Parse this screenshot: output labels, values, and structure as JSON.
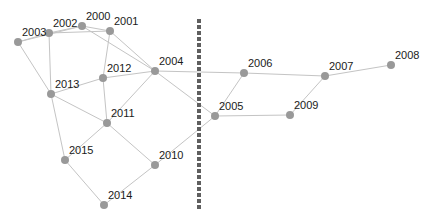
{
  "diagram": {
    "type": "network-graph",
    "node_color": "#999999",
    "edge_color": "#c4c4c4",
    "divider": {
      "x": 199,
      "y1": 19,
      "y2": 209,
      "color": "#5f5f5f",
      "style": "dashed"
    },
    "nodes": [
      {
        "id": "2000",
        "label": "2000",
        "x": 82,
        "y": 26,
        "lx": 4,
        "ly": -6
      },
      {
        "id": "2001",
        "label": "2001",
        "x": 110,
        "y": 31,
        "lx": 4,
        "ly": -6
      },
      {
        "id": "2002",
        "label": "2002",
        "x": 49,
        "y": 33,
        "lx": 4,
        "ly": -6
      },
      {
        "id": "2003",
        "label": "2003",
        "x": 18,
        "y": 42,
        "lx": 4,
        "ly": -6
      },
      {
        "id": "2004",
        "label": "2004",
        "x": 155,
        "y": 71,
        "lx": 4,
        "ly": -6
      },
      {
        "id": "2005",
        "label": "2005",
        "x": 215,
        "y": 116,
        "lx": 4,
        "ly": -6
      },
      {
        "id": "2006",
        "label": "2006",
        "x": 244,
        "y": 73,
        "lx": 4,
        "ly": -6
      },
      {
        "id": "2007",
        "label": "2007",
        "x": 325,
        "y": 76,
        "lx": 4,
        "ly": -6
      },
      {
        "id": "2008",
        "label": "2008",
        "x": 391,
        "y": 65,
        "lx": 4,
        "ly": -6
      },
      {
        "id": "2009",
        "label": "2009",
        "x": 290,
        "y": 115,
        "lx": 4,
        "ly": -6
      },
      {
        "id": "2010",
        "label": "2010",
        "x": 155,
        "y": 165,
        "lx": 4,
        "ly": -6
      },
      {
        "id": "2011",
        "label": "2011",
        "x": 107,
        "y": 123,
        "lx": 4,
        "ly": -6
      },
      {
        "id": "2012",
        "label": "2012",
        "x": 103,
        "y": 78,
        "lx": 4,
        "ly": -6
      },
      {
        "id": "2013",
        "label": "2013",
        "x": 51,
        "y": 94,
        "lx": 4,
        "ly": -6
      },
      {
        "id": "2014",
        "label": "2014",
        "x": 104,
        "y": 205,
        "lx": 4,
        "ly": -6
      },
      {
        "id": "2015",
        "label": "2015",
        "x": 65,
        "y": 160,
        "lx": 4,
        "ly": -6
      }
    ],
    "edges": [
      [
        "2003",
        "2002"
      ],
      [
        "2002",
        "2000"
      ],
      [
        "2000",
        "2001"
      ],
      [
        "2003",
        "2000"
      ],
      [
        "2002",
        "2001"
      ],
      [
        "2000",
        "2004"
      ],
      [
        "2001",
        "2004"
      ],
      [
        "2001",
        "2012"
      ],
      [
        "2002",
        "2013"
      ],
      [
        "2003",
        "2013"
      ],
      [
        "2013",
        "2012"
      ],
      [
        "2012",
        "2004"
      ],
      [
        "2012",
        "2011"
      ],
      [
        "2013",
        "2011"
      ],
      [
        "2013",
        "2015"
      ],
      [
        "2004",
        "2011"
      ],
      [
        "2004",
        "2005"
      ],
      [
        "2004",
        "2006"
      ],
      [
        "2011",
        "2015"
      ],
      [
        "2011",
        "2010"
      ],
      [
        "2015",
        "2014"
      ],
      [
        "2014",
        "2010"
      ],
      [
        "2010",
        "2005"
      ],
      [
        "2005",
        "2006"
      ],
      [
        "2005",
        "2009"
      ],
      [
        "2006",
        "2007"
      ],
      [
        "2009",
        "2007"
      ],
      [
        "2007",
        "2008"
      ]
    ]
  }
}
